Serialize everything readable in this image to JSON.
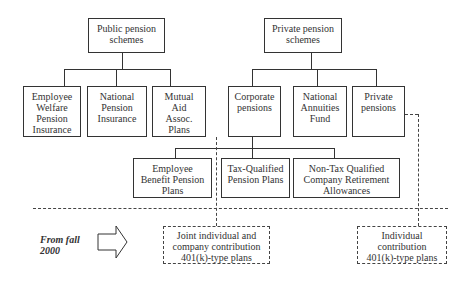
{
  "diagram": {
    "public": {
      "title": "Public pension\nschemes",
      "children": [
        "Employee\nWelfare\nPension\nInsurance",
        "National\nPension\nInsurance",
        "Mutual\nAid\nAssoc.\nPlans"
      ]
    },
    "private": {
      "title": "Private pension\nschemes",
      "children": [
        "Corporate\npensions",
        "National\nAnnuities\nFund",
        "Private\npensions"
      ]
    },
    "corporate_children": [
      "Employee\nBenefit Pension\nPlans",
      "Tax-Qualified\nPension Plans",
      "Non-Tax Qualified\nCompany Retirement\nAllowances"
    ],
    "from_label": "From fall\n2000",
    "new_plans": [
      "Joint individual and\ncompany contribution\n401(k)-type plans",
      "Individual\ncontribution\n401(k)-type plans"
    ]
  }
}
